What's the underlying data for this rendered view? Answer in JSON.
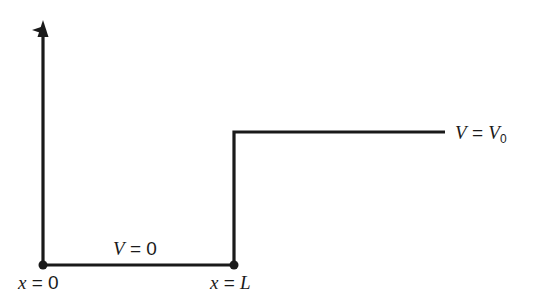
{
  "diagram": {
    "type": "potential-step",
    "line_color": "#1a1a1a",
    "labels": {
      "region_left": {
        "var": "V",
        "eq": " = ",
        "val": "0"
      },
      "region_right": {
        "var": "V",
        "eq": " = ",
        "val": "V",
        "sub": "0"
      },
      "origin": {
        "var": "x",
        "eq": " = ",
        "val": "0"
      },
      "step": {
        "var": "x",
        "eq": " = ",
        "val": "L"
      }
    },
    "geometry": {
      "axis_x": 43,
      "axis_top": 22,
      "floor_y": 265,
      "step_x": 234,
      "step_top_y": 132,
      "step_end_x": 445
    }
  }
}
